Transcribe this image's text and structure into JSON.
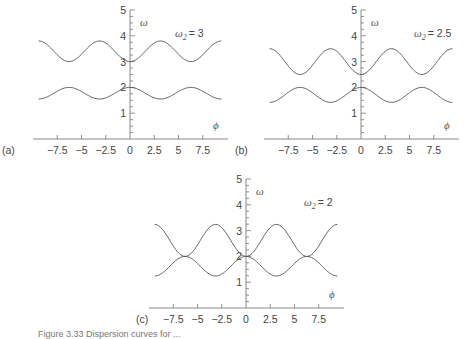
{
  "chart_data": [
    {
      "type": "line",
      "panel_label": "(a)",
      "annotation": "ω2 = 3",
      "xlabel": "ϕ",
      "ylabel": "ω",
      "xticks": [
        "−7.5",
        "−5",
        "−2.5",
        "0",
        "2.5",
        "5",
        "7.5"
      ],
      "yticks": [
        "1",
        "2",
        "3",
        "4",
        "5"
      ],
      "xlim": [
        -9.42,
        9.42
      ],
      "ylim": [
        0,
        5
      ],
      "grid": false,
      "series": [
        {
          "name": "upper branch",
          "x": [
            -9.42,
            -6.28,
            -3.14,
            0,
            3.14,
            6.28,
            9.42
          ],
          "values": [
            3.8,
            3.0,
            3.8,
            3.0,
            3.8,
            3.0,
            3.8
          ]
        },
        {
          "name": "lower branch",
          "x": [
            -9.42,
            -6.28,
            -3.14,
            0,
            3.14,
            6.28,
            9.42
          ],
          "values": [
            1.55,
            2.0,
            1.55,
            2.0,
            1.55,
            2.0,
            1.55
          ]
        }
      ]
    },
    {
      "type": "line",
      "panel_label": "(b)",
      "annotation": "ω2 = 2.5",
      "xlabel": "ϕ",
      "ylabel": "ω",
      "xticks": [
        "−7.5",
        "−5",
        "−2.5",
        "0",
        "2.5",
        "5",
        "7.5"
      ],
      "yticks": [
        "1",
        "2",
        "3",
        "4",
        "5"
      ],
      "xlim": [
        -9.42,
        9.42
      ],
      "ylim": [
        0,
        5
      ],
      "grid": false,
      "series": [
        {
          "name": "upper branch",
          "x": [
            -9.42,
            -6.28,
            -3.14,
            0,
            3.14,
            6.28,
            9.42
          ],
          "values": [
            3.5,
            2.5,
            3.5,
            2.5,
            3.5,
            2.5,
            3.5
          ]
        },
        {
          "name": "lower branch",
          "x": [
            -9.42,
            -6.28,
            -3.14,
            0,
            3.14,
            6.28,
            9.42
          ],
          "values": [
            1.42,
            2.0,
            1.42,
            2.0,
            1.42,
            2.0,
            1.42
          ]
        }
      ]
    },
    {
      "type": "line",
      "panel_label": "(c)",
      "annotation": "ω2 = 2",
      "xlabel": "ϕ",
      "ylabel": "ω",
      "xticks": [
        "−7.5",
        "−5",
        "−2.5",
        "0",
        "2.5",
        "5",
        "7.5"
      ],
      "yticks": [
        "1",
        "2",
        "3",
        "4",
        "5"
      ],
      "xlim": [
        -9.42,
        9.42
      ],
      "ylim": [
        0,
        5
      ],
      "grid": false,
      "series": [
        {
          "name": "branch 1",
          "x": [
            -9.42,
            -6.28,
            -3.14,
            0,
            3.14,
            6.28,
            9.42
          ],
          "values": [
            3.24,
            2.0,
            1.24,
            2.0,
            3.24,
            2.0,
            1.24
          ]
        },
        {
          "name": "branch 2",
          "x": [
            -9.42,
            -6.28,
            -3.14,
            0,
            3.14,
            6.28,
            9.42
          ],
          "values": [
            1.24,
            2.0,
            3.24,
            2.0,
            1.24,
            2.0,
            3.24
          ]
        }
      ]
    }
  ],
  "panels": {
    "a": {
      "label": "(a)",
      "omega2": "= 3"
    },
    "b": {
      "label": "(b)",
      "omega2": "= 2.5"
    },
    "c": {
      "label": "(c)",
      "omega2": "= 2"
    }
  },
  "axis_labels": {
    "x": "ϕ",
    "y": "ω",
    "omega": "ω",
    "sub": "2"
  },
  "xticks": [
    "−7.5",
    "−5",
    "−2.5",
    "0",
    "2.5",
    "5",
    "7.5"
  ],
  "yticks": [
    "1",
    "2",
    "3",
    "4",
    "5"
  ],
  "caption": "Figure 3.33   Dispersion curves for ..."
}
